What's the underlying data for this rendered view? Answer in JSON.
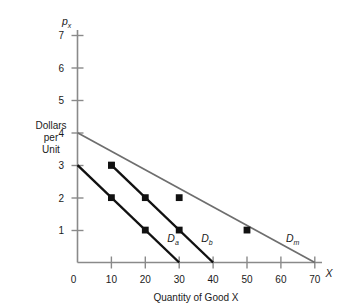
{
  "chart_data": {
    "type": "line",
    "title": "",
    "xlabel": "Quantity of Good X",
    "ylabel": "Dollars per Unit",
    "y_axis_symbol": "p",
    "y_axis_symbol_sub": "x",
    "x_axis_symbol": "X",
    "xlim": [
      0,
      72
    ],
    "ylim": [
      0,
      7.4
    ],
    "xticks": [
      0,
      10,
      20,
      30,
      40,
      50,
      60,
      70
    ],
    "xtick_labels": [
      "0",
      "10",
      "20",
      "30",
      "40",
      "50",
      "60",
      "70"
    ],
    "yticks": [
      1,
      2,
      3,
      4,
      5,
      6,
      7
    ],
    "ytick_labels": [
      "1",
      "2",
      "3",
      "4",
      "5",
      "6",
      "7"
    ],
    "grid": false,
    "legend_position": "inline-annotations",
    "series": [
      {
        "name": "Da",
        "label_base": "D",
        "label_sub": "a",
        "color": "#111111",
        "width": 2.4,
        "line": [
          [
            0,
            3
          ],
          [
            30,
            0
          ]
        ],
        "markers": [
          [
            10,
            2
          ],
          [
            20,
            1
          ]
        ],
        "label_at": [
          26.5,
          0.62
        ]
      },
      {
        "name": "Db",
        "label_base": "D",
        "label_sub": "b",
        "color": "#111111",
        "width": 2.4,
        "line": [
          [
            10,
            3
          ],
          [
            40,
            0
          ]
        ],
        "markers": [
          [
            10,
            3
          ],
          [
            20,
            2
          ],
          [
            30,
            1
          ]
        ],
        "label_at": [
          36.5,
          0.62
        ]
      },
      {
        "name": "Dm",
        "label_base": "D",
        "label_sub": "m",
        "color": "#6e6e6e",
        "width": 1.7,
        "line": [
          [
            0,
            4
          ],
          [
            70,
            0
          ]
        ],
        "markers": [
          [
            30,
            2
          ],
          [
            50,
            1
          ]
        ],
        "label_at": [
          61.5,
          0.62
        ]
      }
    ]
  },
  "labels": {
    "ylabel_line1": "Dollars",
    "ylabel_line2": "per",
    "ylabel_line3": "Unit",
    "xlabel": "Quantity of Good X",
    "x_symbol": "X",
    "y_symbol": "p",
    "y_symbol_sub": "x",
    "tick_x_0": "0",
    "tick_x_10": "10",
    "tick_x_20": "20",
    "tick_x_30": "30",
    "tick_x_40": "40",
    "tick_x_50": "50",
    "tick_x_60": "60",
    "tick_x_70": "70",
    "tick_y_1": "1",
    "tick_y_2": "2",
    "tick_y_3": "3",
    "tick_y_4": "4",
    "tick_y_5": "5",
    "tick_y_6": "6",
    "tick_y_7": "7",
    "curve_a_base": "D",
    "curve_a_sub": "a",
    "curve_b_base": "D",
    "curve_b_sub": "b",
    "curve_m_base": "D",
    "curve_m_sub": "m"
  },
  "colors": {
    "axis": "#8a8a8a",
    "dark_curve": "#111111",
    "light_curve": "#6e6e6e",
    "text": "#1a1a1a",
    "background": "#ffffff"
  }
}
